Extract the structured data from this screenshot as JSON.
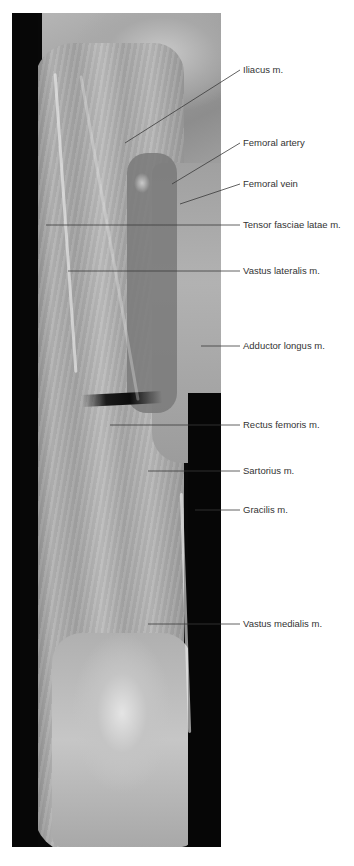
{
  "figure": {
    "colors": {
      "background": "#ffffff",
      "label_text": "#333333",
      "leader_line": "#3a3a3a"
    },
    "labels": [
      {
        "id": "iliacus",
        "text": "Iliacus m.",
        "y": 70,
        "leader": {
          "x1": 240,
          "y1": 70,
          "x2": 125,
          "y2": 143
        }
      },
      {
        "id": "femoral-artery",
        "text": "Femoral artery",
        "y": 143,
        "leader": {
          "x1": 240,
          "y1": 143,
          "x2": 172,
          "y2": 184
        }
      },
      {
        "id": "femoral-vein",
        "text": "Femoral vein",
        "y": 184,
        "leader": {
          "x1": 240,
          "y1": 184,
          "x2": 180,
          "y2": 204
        }
      },
      {
        "id": "tensor-fasciae-latae",
        "text": "Tensor fasciae latae m.",
        "y": 225,
        "leader": {
          "x1": 240,
          "y1": 225,
          "x2": 46,
          "y2": 225
        }
      },
      {
        "id": "vastus-lateralis",
        "text": "Vastus lateralis m.",
        "y": 271,
        "leader": {
          "x1": 240,
          "y1": 271,
          "x2": 68,
          "y2": 271
        }
      },
      {
        "id": "adductor-longus",
        "text": "Adductor longus m.",
        "y": 346,
        "leader": {
          "x1": 240,
          "y1": 346,
          "x2": 201,
          "y2": 346
        }
      },
      {
        "id": "rectus-femoris",
        "text": "Rectus femoris m.",
        "y": 425,
        "leader": {
          "x1": 240,
          "y1": 425,
          "x2": 110,
          "y2": 425
        }
      },
      {
        "id": "sartorius",
        "text": "Sartorius m.",
        "y": 471,
        "leader": {
          "x1": 240,
          "y1": 471,
          "x2": 148,
          "y2": 471
        }
      },
      {
        "id": "gracilis",
        "text": "Gracilis m.",
        "y": 510,
        "leader": {
          "x1": 240,
          "y1": 510,
          "x2": 195,
          "y2": 510
        }
      },
      {
        "id": "vastus-medialis",
        "text": "Vastus medialis m.",
        "y": 624,
        "leader": {
          "x1": 240,
          "y1": 624,
          "x2": 148,
          "y2": 624
        }
      }
    ]
  }
}
